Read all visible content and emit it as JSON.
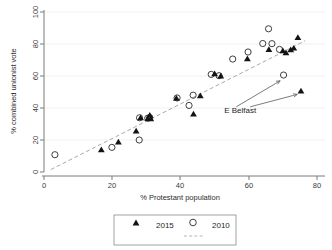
{
  "chart_data": {
    "type": "scatter",
    "title": "",
    "xlabel": "% Protestant population",
    "ylabel": "% combined unionist vote",
    "xlim": [
      0,
      80
    ],
    "ylim": [
      0,
      100
    ],
    "xticks": [
      0,
      20,
      40,
      60,
      80
    ],
    "yticks": [
      0,
      20,
      40,
      60,
      80,
      100
    ],
    "grid": true,
    "legend_position": "below-plot",
    "series": [
      {
        "name": "2015",
        "marker": "filled-triangle",
        "color": "#141414",
        "points": [
          [
            16.8,
            14.0
          ],
          [
            21.8,
            18.8
          ],
          [
            27.0,
            25.7
          ],
          [
            28.3,
            34.0
          ],
          [
            30.4,
            33.5
          ],
          [
            31.0,
            35.5
          ],
          [
            31.3,
            33.3
          ],
          [
            38.8,
            46.2
          ],
          [
            43.8,
            36.3
          ],
          [
            45.8,
            47.7
          ],
          [
            50.0,
            61.5
          ],
          [
            51.8,
            60.1
          ],
          [
            59.6,
            70.8
          ],
          [
            65.9,
            76.6
          ],
          [
            70.0,
            75.9
          ],
          [
            70.9,
            74.6
          ],
          [
            72.3,
            76.5
          ],
          [
            73.2,
            77.5
          ],
          [
            74.4,
            84.2
          ],
          [
            75.3,
            50.7
          ]
        ]
      },
      {
        "name": "2010",
        "marker": "open-circle",
        "color": "#2a2a2a",
        "points": [
          [
            3.2,
            10.8
          ],
          [
            19.9,
            15.4
          ],
          [
            27.9,
            20.0
          ],
          [
            28.0,
            33.9
          ],
          [
            30.4,
            33.6
          ],
          [
            31.0,
            34.0
          ],
          [
            39.0,
            46.3
          ],
          [
            42.5,
            41.6
          ],
          [
            43.7,
            48.0
          ],
          [
            49.0,
            61.0
          ],
          [
            51.3,
            60.2
          ],
          [
            55.3,
            70.6
          ],
          [
            59.8,
            75.0
          ],
          [
            64.1,
            80.3
          ],
          [
            65.8,
            89.5
          ],
          [
            66.8,
            80.2
          ],
          [
            69.0,
            76.6
          ],
          [
            70.2,
            60.6
          ]
        ]
      }
    ],
    "fit_line": {
      "name": "fitted values",
      "style": "dashed",
      "color": "#a9a9a9",
      "x": [
        2.0,
        76.5
      ],
      "y": [
        1.5,
        82.0
      ]
    },
    "annotations": [
      {
        "label": "E Belfast",
        "x": 57.5,
        "y": 37.0,
        "arrow_targets": [
          [
            69.2,
            57.0
          ],
          [
            74.2,
            48.5
          ]
        ]
      }
    ]
  },
  "legend": {
    "entries": [
      {
        "label": "2015",
        "marker": "filled-triangle"
      },
      {
        "label": "2010",
        "marker": "open-circle"
      }
    ],
    "fit_entry": {
      "label": "",
      "marker": "dashed-line"
    }
  }
}
